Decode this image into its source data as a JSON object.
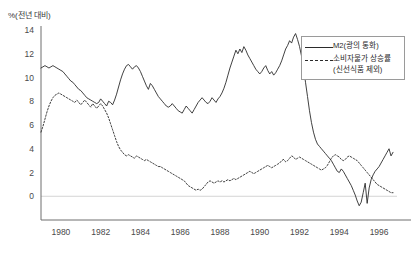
{
  "chart_data": {
    "type": "line",
    "title": "",
    "subtitle": "",
    "ylabel": "%(전년 대비)",
    "xlabel": "",
    "ylim": [
      -2,
      14
    ],
    "xlim": [
      1979.0,
      1996.9
    ],
    "yticks": [
      0,
      2,
      4,
      6,
      8,
      10,
      12,
      14
    ],
    "xticks": [
      1980,
      1982,
      1984,
      1986,
      1988,
      1990,
      1992,
      1994,
      1996
    ],
    "ytick_labels": [
      "0",
      "2",
      "4",
      "6",
      "8",
      "10",
      "12",
      "14"
    ],
    "xtick_labels": [
      "1980",
      "1982",
      "1984",
      "1986",
      "1988",
      "1990",
      "1992",
      "1994",
      "1996"
    ],
    "grid": false,
    "zero_line": true,
    "legend_position": "top-right",
    "legend": [
      "M2(광의 통화)",
      "소비자물가 상승률\n(신선식품 제외)"
    ],
    "series": [
      {
        "name": "M2(광의 통화)",
        "style": "solid",
        "color": "#2b2b2b",
        "x": [
          1979.0,
          1979.1,
          1979.2,
          1979.3,
          1979.4,
          1979.5,
          1979.6,
          1979.7,
          1979.8,
          1979.9,
          1980.0,
          1980.1,
          1980.2,
          1980.3,
          1980.4,
          1980.5,
          1980.6,
          1980.7,
          1980.8,
          1980.9,
          1981.0,
          1981.1,
          1981.2,
          1981.3,
          1981.4,
          1981.5,
          1981.6,
          1981.7,
          1981.8,
          1981.9,
          1982.0,
          1982.1,
          1982.2,
          1982.3,
          1982.4,
          1982.5,
          1982.6,
          1982.7,
          1982.8,
          1982.9,
          1983.0,
          1983.1,
          1983.2,
          1983.3,
          1983.4,
          1983.5,
          1983.6,
          1983.7,
          1983.8,
          1983.9,
          1984.0,
          1984.1,
          1984.2,
          1984.3,
          1984.4,
          1984.5,
          1984.6,
          1984.7,
          1984.8,
          1984.9,
          1985.0,
          1985.1,
          1985.2,
          1985.3,
          1985.4,
          1985.5,
          1985.6,
          1985.7,
          1985.8,
          1985.9,
          1986.0,
          1986.1,
          1986.2,
          1986.3,
          1986.4,
          1986.5,
          1986.6,
          1986.7,
          1986.8,
          1986.9,
          1987.0,
          1987.1,
          1987.2,
          1987.3,
          1987.4,
          1987.5,
          1987.6,
          1987.7,
          1987.8,
          1987.9,
          1988.0,
          1988.1,
          1988.2,
          1988.3,
          1988.4,
          1988.5,
          1988.6,
          1988.7,
          1988.8,
          1988.9,
          1989.0,
          1989.1,
          1989.2,
          1989.3,
          1989.4,
          1989.5,
          1989.6,
          1989.7,
          1989.8,
          1989.9,
          1990.0,
          1990.1,
          1990.2,
          1990.3,
          1990.4,
          1990.5,
          1990.6,
          1990.7,
          1990.8,
          1990.9,
          1991.0,
          1991.1,
          1991.2,
          1991.3,
          1991.4,
          1991.5,
          1991.6,
          1991.7,
          1991.8,
          1991.9,
          1992.0,
          1992.1,
          1992.2,
          1992.3,
          1992.4,
          1992.5,
          1992.6,
          1992.7,
          1992.8,
          1992.9,
          1993.0,
          1993.1,
          1993.2,
          1993.3,
          1993.4,
          1993.5,
          1993.6,
          1993.7,
          1993.8,
          1993.9,
          1994.0,
          1994.1,
          1994.2,
          1994.3,
          1994.4,
          1994.5,
          1994.6,
          1994.7,
          1994.8,
          1994.9,
          1995.0,
          1995.1,
          1995.2,
          1995.3,
          1995.4,
          1995.5,
          1995.6,
          1995.7,
          1995.8,
          1995.9,
          1996.0,
          1996.1,
          1996.2,
          1996.3,
          1996.4,
          1996.5,
          1996.6,
          1996.7
        ],
        "values": [
          10.8,
          10.9,
          11.0,
          10.9,
          10.8,
          10.9,
          11.0,
          10.9,
          10.8,
          10.7,
          10.6,
          10.5,
          10.3,
          10.1,
          9.9,
          9.7,
          9.6,
          9.4,
          9.2,
          9.0,
          8.9,
          8.7,
          8.5,
          8.3,
          8.2,
          8.1,
          8.0,
          7.9,
          7.8,
          7.9,
          8.2,
          8.0,
          7.8,
          7.6,
          8.0,
          7.9,
          7.7,
          8.1,
          8.6,
          9.2,
          9.8,
          10.3,
          10.7,
          11.0,
          11.1,
          10.9,
          10.7,
          10.9,
          11.0,
          10.8,
          10.5,
          10.1,
          9.7,
          9.3,
          9.0,
          9.5,
          9.3,
          9.0,
          8.7,
          8.4,
          8.2,
          8.0,
          7.8,
          7.6,
          7.5,
          7.6,
          7.8,
          7.6,
          7.4,
          7.2,
          7.1,
          7.0,
          7.3,
          7.6,
          7.4,
          7.2,
          7.0,
          7.3,
          7.6,
          7.9,
          8.1,
          8.3,
          8.1,
          7.9,
          7.8,
          8.0,
          8.3,
          8.1,
          7.9,
          8.2,
          8.4,
          8.7,
          9.1,
          9.6,
          10.2,
          10.8,
          11.3,
          11.8,
          12.3,
          12.0,
          12.4,
          12.1,
          12.6,
          12.3,
          11.9,
          11.6,
          11.3,
          11.0,
          10.7,
          10.5,
          10.3,
          10.5,
          10.8,
          11.0,
          10.6,
          10.3,
          10.5,
          10.2,
          10.4,
          10.7,
          11.0,
          11.4,
          11.9,
          12.4,
          12.7,
          13.1,
          12.9,
          13.4,
          13.7,
          13.2,
          12.6,
          11.8,
          10.8,
          9.6,
          8.4,
          7.2,
          6.2,
          5.4,
          4.8,
          4.4,
          4.2,
          4.0,
          3.8,
          3.6,
          3.4,
          3.2,
          3.0,
          2.7,
          2.4,
          2.1,
          2.0,
          2.3,
          2.1,
          1.8,
          1.5,
          1.2,
          0.9,
          0.5,
          0.1,
          -0.4,
          -0.8,
          -0.5,
          0.3,
          1.1,
          -0.6,
          0.7,
          1.4,
          1.8,
          2.1,
          2.3,
          2.5,
          2.8,
          3.1,
          3.4,
          3.7,
          4.0,
          3.4,
          3.7
        ]
      },
      {
        "name": "소비자물가 상승률(신선식품 제외)",
        "style": "dotted",
        "color": "#2b2b2b",
        "x": [
          1979.0,
          1979.1,
          1979.2,
          1979.3,
          1979.4,
          1979.5,
          1979.6,
          1979.7,
          1979.8,
          1979.9,
          1980.0,
          1980.1,
          1980.2,
          1980.3,
          1980.4,
          1980.5,
          1980.6,
          1980.7,
          1980.8,
          1980.9,
          1981.0,
          1981.1,
          1981.2,
          1981.3,
          1981.4,
          1981.5,
          1981.6,
          1981.7,
          1981.8,
          1981.9,
          1982.0,
          1982.1,
          1982.2,
          1982.3,
          1982.4,
          1982.5,
          1982.6,
          1982.7,
          1982.8,
          1982.9,
          1983.0,
          1983.1,
          1983.2,
          1983.3,
          1983.4,
          1983.5,
          1983.6,
          1983.7,
          1983.8,
          1983.9,
          1984.0,
          1984.1,
          1984.2,
          1984.3,
          1984.4,
          1984.5,
          1984.6,
          1984.7,
          1984.8,
          1984.9,
          1985.0,
          1985.1,
          1985.2,
          1985.3,
          1985.4,
          1985.5,
          1985.6,
          1985.7,
          1985.8,
          1985.9,
          1986.0,
          1986.1,
          1986.2,
          1986.3,
          1986.4,
          1986.5,
          1986.6,
          1986.7,
          1986.8,
          1986.9,
          1987.0,
          1987.1,
          1987.2,
          1987.3,
          1987.4,
          1987.5,
          1987.6,
          1987.7,
          1987.8,
          1987.9,
          1988.0,
          1988.1,
          1988.2,
          1988.3,
          1988.4,
          1988.5,
          1988.6,
          1988.7,
          1988.8,
          1988.9,
          1989.0,
          1989.1,
          1989.2,
          1989.3,
          1989.4,
          1989.5,
          1989.6,
          1989.7,
          1989.8,
          1989.9,
          1990.0,
          1990.1,
          1990.2,
          1990.3,
          1990.4,
          1990.5,
          1990.6,
          1990.7,
          1990.8,
          1990.9,
          1991.0,
          1991.1,
          1991.2,
          1991.3,
          1991.4,
          1991.5,
          1991.6,
          1991.7,
          1991.8,
          1991.9,
          1992.0,
          1992.1,
          1992.2,
          1992.3,
          1992.4,
          1992.5,
          1992.6,
          1992.7,
          1992.8,
          1992.9,
          1993.0,
          1993.1,
          1993.2,
          1993.3,
          1993.4,
          1993.5,
          1993.6,
          1993.7,
          1993.8,
          1993.9,
          1994.0,
          1994.1,
          1994.2,
          1994.3,
          1994.4,
          1994.5,
          1994.6,
          1994.7,
          1994.8,
          1994.9,
          1995.0,
          1995.1,
          1995.2,
          1995.3,
          1995.4,
          1995.5,
          1995.6,
          1995.7,
          1995.8,
          1995.9,
          1996.0,
          1996.1,
          1996.2,
          1996.3,
          1996.4,
          1996.5,
          1996.6,
          1996.7
        ],
        "values": [
          5.4,
          5.9,
          6.5,
          7.1,
          7.6,
          8.0,
          8.3,
          8.5,
          8.6,
          8.7,
          8.6,
          8.5,
          8.4,
          8.3,
          8.2,
          8.1,
          8.0,
          7.9,
          8.1,
          7.9,
          7.7,
          7.9,
          8.1,
          7.9,
          7.7,
          7.5,
          7.8,
          7.6,
          7.4,
          7.6,
          7.8,
          7.6,
          7.3,
          7.0,
          6.6,
          6.1,
          5.6,
          5.1,
          4.6,
          4.2,
          3.9,
          3.7,
          3.5,
          3.4,
          3.5,
          3.4,
          3.3,
          3.2,
          3.4,
          3.3,
          3.2,
          3.1,
          3.0,
          3.1,
          3.0,
          2.9,
          2.8,
          2.7,
          2.6,
          2.5,
          2.5,
          2.4,
          2.3,
          2.2,
          2.1,
          2.0,
          1.9,
          1.8,
          1.7,
          1.6,
          1.5,
          1.4,
          1.3,
          1.1,
          0.9,
          0.8,
          0.7,
          0.6,
          0.5,
          0.6,
          0.5,
          0.6,
          0.8,
          1.0,
          1.2,
          1.3,
          1.2,
          1.1,
          1.2,
          1.3,
          1.2,
          1.3,
          1.2,
          1.3,
          1.4,
          1.3,
          1.4,
          1.5,
          1.4,
          1.5,
          1.6,
          1.7,
          1.8,
          1.9,
          2.0,
          2.1,
          2.0,
          1.9,
          2.0,
          2.1,
          2.2,
          2.3,
          2.4,
          2.5,
          2.6,
          2.5,
          2.4,
          2.5,
          2.6,
          2.7,
          2.8,
          3.0,
          3.1,
          2.9,
          3.0,
          3.2,
          3.4,
          3.3,
          3.1,
          3.2,
          3.3,
          3.2,
          3.1,
          3.0,
          2.9,
          2.8,
          2.7,
          2.6,
          2.5,
          2.4,
          2.3,
          2.2,
          2.3,
          2.4,
          2.6,
          2.9,
          3.2,
          3.4,
          3.5,
          3.4,
          3.3,
          3.1,
          3.0,
          3.1,
          3.3,
          3.4,
          3.3,
          3.2,
          3.1,
          3.0,
          2.8,
          2.6,
          2.4,
          2.2,
          2.0,
          1.8,
          1.6,
          1.4,
          1.2,
          1.0,
          0.9,
          0.8,
          0.7,
          0.6,
          0.5,
          0.4,
          0.3,
          0.3
        ]
      }
    ]
  },
  "legend": {
    "items": [
      {
        "label": "M2(광의 통화)",
        "style": "solid"
      },
      {
        "label": "소비자물가 상승률",
        "label2": "(신선식품 제외)",
        "style": "dotted"
      }
    ]
  },
  "colors": {
    "line": "#2b2b2b",
    "axis": "#6e6e6e",
    "tick_text": "#4a4a4a",
    "background": "#ffffff"
  }
}
